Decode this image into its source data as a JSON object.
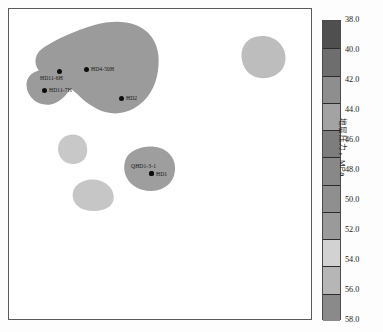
{
  "figure": {
    "kind": "contour-map",
    "background": "#ffffff",
    "frame_color": "#5a5a5a"
  },
  "chart_data": {
    "type": "heatmap",
    "title": "",
    "xlabel": "",
    "ylabel": "",
    "colorbar": {
      "label": "地层压力，MPa",
      "unit": "MPa",
      "min": 38.0,
      "max": 58.0,
      "step": 2.0,
      "orientation": "vertical",
      "position": "right",
      "reversed": true,
      "ticks": [
        "38.0",
        "40.0",
        "42.0",
        "44.0",
        "46.0",
        "48.0",
        "50.0",
        "52.0",
        "54.0",
        "56.0",
        "58.0"
      ],
      "band_colors": [
        "#4f4f4f",
        "#6e6e6e",
        "#8e8e8e",
        "#a3a3a3",
        "#7d7d7d",
        "#888888",
        "#8f8f8f",
        "#9a9a9a",
        "#d2d2d2",
        "#b6b6b6",
        "#8a8a8a"
      ]
    },
    "grid": false,
    "legend": "none",
    "regions": [
      {
        "name": "northwest-high-pressure-lobe",
        "fill": "#9b9b9b",
        "value_band": "42.0-46.0"
      },
      {
        "name": "northeast-isolated-patch",
        "fill": "#bdbdbd",
        "value_band": "46.0-48.0"
      },
      {
        "name": "west-small-patch",
        "fill": "#c8c8c8",
        "value_band": "48.0-50.0"
      },
      {
        "name": "southwest-small-patch",
        "fill": "#c6c6c6",
        "value_band": "48.0-50.0"
      },
      {
        "name": "central-patch",
        "fill": "#9e9e9e",
        "value_band": "44.0-46.0"
      }
    ],
    "wells": [
      {
        "name": "HD11-6H",
        "x_px": 48,
        "y_px": 60,
        "label_dx": -17,
        "label_dy": 6
      },
      {
        "name": "HD4-50H",
        "x_px": 75,
        "y_px": 58,
        "label_dx": 6,
        "label_dy": -2
      },
      {
        "name": "HD11-7H",
        "x_px": 33,
        "y_px": 79,
        "label_dx": 6,
        "label_dy": -1
      },
      {
        "name": "HD2",
        "x_px": 110,
        "y_px": 87,
        "label_dx": 6,
        "label_dy": -1
      },
      {
        "name": "QHD1-3-1",
        "x_px": 140,
        "y_px": 162,
        "label_dx": -18,
        "label_dy": -8
      },
      {
        "name": "HD1",
        "x_px": 140,
        "y_px": 162,
        "label_dx": 6,
        "label_dy": -1
      }
    ]
  }
}
